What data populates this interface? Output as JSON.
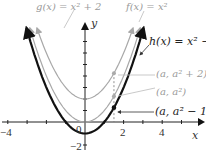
{
  "chart_data": {
    "type": "line",
    "title": "",
    "xlabel": "x",
    "ylabel": "y",
    "xlim": [
      -4.4,
      6
    ],
    "ylim": [
      -2.5,
      8.2
    ],
    "x_ticks": [
      -4,
      -3,
      -2,
      -1,
      0,
      1,
      2,
      3,
      4,
      5
    ],
    "x_tick_labels": [
      "-4",
      "2",
      "4"
    ],
    "y_tick_labels": [
      "0",
      "-2"
    ],
    "series": [
      {
        "name": "g(x) = x² + 2",
        "expr": "x^2+2",
        "color": "#a8a8a8",
        "width": 1.2
      },
      {
        "name": "f(x) = x²",
        "expr": "x^2",
        "color": "#a8a8a8",
        "width": 1.2
      },
      {
        "name": "h(x) = x² − 1",
        "expr": "x^2-1",
        "color": "#111111",
        "width": 2.2
      }
    ],
    "annotations": [
      {
        "text": "(a, a² + 2)",
        "x": 1.5,
        "y": 4.25
      },
      {
        "text": "(a, a²)",
        "x": 1.5,
        "y": 2.25
      },
      {
        "text": "(a, a² − 1)",
        "x": 1.5,
        "y": 1.25
      }
    ],
    "a_value": 1.5,
    "grid": false,
    "legend": "none (inline labels)"
  },
  "labels": {
    "g": "g(x) = x² + 2",
    "f": "f(x) = x²",
    "h": "h(x) = x² − 1",
    "p_g": "(a, a² + 2)",
    "p_f": "(a, a²)",
    "p_h": "(a, a² − 1)",
    "x_axis": "x",
    "y_axis": "y",
    "x_neg4": "−4",
    "x_2": "2",
    "x_4": "4",
    "origin": "0",
    "y_neg2": "−2"
  }
}
